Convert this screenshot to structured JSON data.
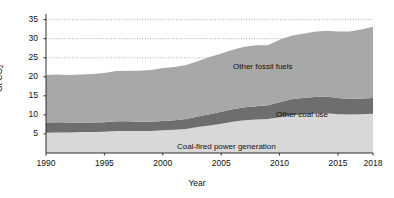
{
  "chart_data": {
    "type": "area",
    "title": "",
    "subtitle": "",
    "xlabel": "Year",
    "ylabel": "Gt CO2",
    "ylabel_display": "Gt CO",
    "ylabel_sub": "2",
    "stacked": true,
    "grid": true,
    "grid_style": "dotted",
    "gridlines_at": [
      25,
      30,
      35
    ],
    "legend_position": "inline-annotations",
    "xlim": [
      1990,
      2018
    ],
    "ylim": [
      0,
      37
    ],
    "xticks": [
      1990,
      1995,
      2000,
      2005,
      2010,
      2015,
      2018
    ],
    "xticklabels": [
      "1990",
      "1995",
      "2000",
      "2005",
      "2010",
      "2015",
      "2018"
    ],
    "yticks": [
      5,
      10,
      15,
      20,
      25,
      30,
      35
    ],
    "yticklabels": [
      "5",
      "10",
      "15",
      "20",
      "25",
      "30",
      "35"
    ],
    "x": [
      1990,
      1991,
      1992,
      1993,
      1994,
      1995,
      1996,
      1997,
      1998,
      1999,
      2000,
      2001,
      2002,
      2003,
      2004,
      2005,
      2006,
      2007,
      2008,
      2009,
      2010,
      2011,
      2012,
      2013,
      2014,
      2015,
      2016,
      2017,
      2018
    ],
    "series": [
      {
        "name": "Coal-fired power generation",
        "color": "#d8d8d8",
        "values": [
          5.3,
          5.4,
          5.4,
          5.5,
          5.5,
          5.6,
          5.8,
          5.8,
          5.8,
          5.8,
          6.0,
          6.1,
          6.3,
          6.8,
          7.2,
          7.7,
          8.2,
          8.6,
          8.8,
          8.9,
          9.4,
          9.9,
          10.1,
          10.3,
          10.4,
          10.2,
          10.1,
          10.2,
          10.3
        ]
      },
      {
        "name": "Other coal use",
        "color": "#6e6e6e",
        "values": [
          2.7,
          2.7,
          2.6,
          2.5,
          2.5,
          2.5,
          2.5,
          2.5,
          2.4,
          2.4,
          2.4,
          2.5,
          2.6,
          2.8,
          3.0,
          3.1,
          3.3,
          3.4,
          3.5,
          3.6,
          3.9,
          4.2,
          4.3,
          4.4,
          4.4,
          4.2,
          4.1,
          4.1,
          4.1
        ]
      },
      {
        "name": "Other fossil fuels",
        "color": "#a8a8a8",
        "values": [
          12.5,
          12.5,
          12.5,
          12.6,
          12.7,
          12.9,
          13.2,
          13.3,
          13.4,
          13.6,
          13.9,
          14.0,
          14.2,
          14.5,
          15.0,
          15.3,
          15.6,
          15.9,
          16.0,
          15.8,
          16.4,
          16.7,
          16.9,
          17.1,
          17.3,
          17.5,
          17.7,
          18.1,
          18.7
        ]
      }
    ],
    "totals": [
      20.5,
      20.6,
      20.5,
      20.6,
      20.7,
      21.0,
      21.5,
      21.6,
      21.6,
      21.8,
      22.3,
      22.6,
      23.1,
      24.1,
      25.2,
      26.1,
      27.1,
      27.9,
      28.3,
      28.3,
      29.7,
      30.8,
      31.3,
      31.8,
      32.1,
      31.9,
      31.9,
      32.4,
      33.1
    ],
    "annotations": [
      {
        "name": "other-fossil-fuels-label",
        "text": "Other fossil fuels",
        "x_px": 233,
        "y_px": 62
      },
      {
        "name": "other-coal-use-label",
        "text": "Other coal use",
        "x_px": 276,
        "y_px": 110
      },
      {
        "name": "coal-power-label",
        "text": "Coal-fired power generation",
        "x_px": 177,
        "y_px": 142
      }
    ],
    "axis_color": "#1a1a1a",
    "background": "#ffffff"
  }
}
